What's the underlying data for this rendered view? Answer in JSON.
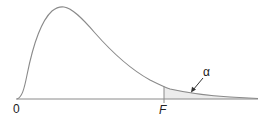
{
  "figure": {
    "labels": {
      "origin": "0",
      "critical_value": "F",
      "tail_area": "α"
    },
    "colors": {
      "curve": "#8a8a8a",
      "axis": "#8a8a8a",
      "tail_fill": "#ececec",
      "text": "#222222"
    }
  }
}
